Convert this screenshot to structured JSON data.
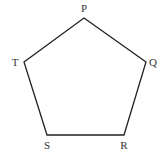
{
  "diagram": {
    "type": "pentagon",
    "stroke_color": "#222222",
    "vertices": [
      {
        "label": "P",
        "x": 84,
        "y": 18,
        "lx": 84,
        "ly": 12
      },
      {
        "label": "Q",
        "x": 146,
        "y": 62,
        "lx": 153,
        "ly": 66
      },
      {
        "label": "R",
        "x": 124,
        "y": 135,
        "lx": 124,
        "ly": 149
      },
      {
        "label": "S",
        "x": 47,
        "y": 135,
        "lx": 47,
        "ly": 149
      },
      {
        "label": "T",
        "x": 24,
        "y": 62,
        "lx": 15,
        "ly": 66
      }
    ]
  }
}
